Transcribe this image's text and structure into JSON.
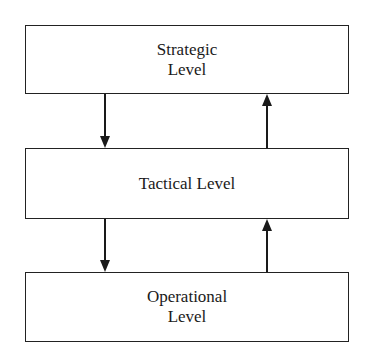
{
  "diagram": {
    "boxes": [
      {
        "line1": "Strategic",
        "line2": "Level"
      },
      {
        "line1": "Tactical Level",
        "line2": ""
      },
      {
        "line1": "Operational",
        "line2": "Level"
      }
    ],
    "arrows": [
      {
        "from": "Strategic Level",
        "to": "Tactical Level",
        "direction": "down"
      },
      {
        "from": "Tactical Level",
        "to": "Strategic Level",
        "direction": "up"
      },
      {
        "from": "Tactical Level",
        "to": "Operational Level",
        "direction": "down"
      },
      {
        "from": "Operational Level",
        "to": "Tactical Level",
        "direction": "up"
      }
    ]
  }
}
